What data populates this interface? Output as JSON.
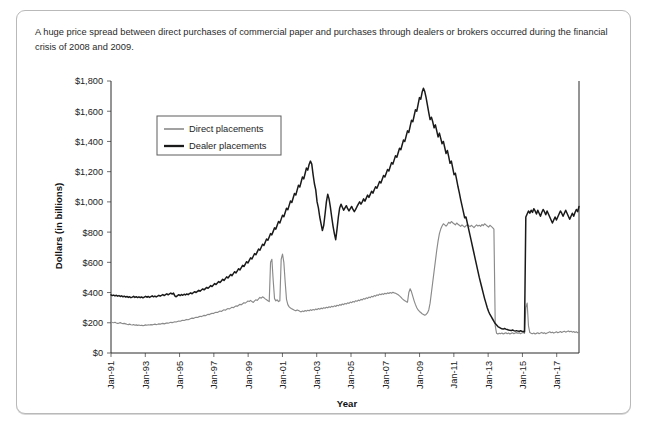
{
  "figure": {
    "caption": "A huge price spread between direct purchases of commercial paper and purchases through dealers or brokers occurred during the financial crisis of 2008 and 2009."
  },
  "legend": {
    "direct_label": "Direct placements",
    "dealer_label": "Dealer placements"
  },
  "axes": {
    "ylabel": "Dollars (in billions)",
    "xlabel": "Year"
  },
  "colors": {
    "direct": "#8a8a8a",
    "dealer": "#1a1a1a",
    "frame": "#b9b9b9",
    "axis": "#2b2b2b"
  },
  "chart_data": {
    "type": "line",
    "title": "",
    "xlabel": "Year",
    "ylabel": "Dollars (in billions)",
    "xlim": [
      "Jan-91",
      "Jan-18"
    ],
    "ylim": [
      0,
      1800
    ],
    "ytick_labels": [
      "$0",
      "$200",
      "$400",
      "$600",
      "$800",
      "$1,000",
      "$1,200",
      "$1,400",
      "$1,600",
      "$1,800"
    ],
    "ytick_values": [
      0,
      200,
      400,
      600,
      800,
      1000,
      1200,
      1400,
      1600,
      1800
    ],
    "ytick_step": 200,
    "xtick_labels": [
      "Jan-91",
      "Jan-93",
      "Jan-95",
      "Jan-97",
      "Jan-99",
      "Jan-01",
      "Jan-03",
      "Jan-05",
      "Jan-07",
      "Jan-09",
      "Jan-11",
      "Jan-13",
      "Jan-15",
      "Jan-17"
    ],
    "xtick_years": [
      1991,
      1993,
      1995,
      1997,
      1999,
      2001,
      2003,
      2005,
      2007,
      2009,
      2011,
      2013,
      2015,
      2017
    ],
    "grid": false,
    "legend_position": "upper-left-inside",
    "x_start_year": 1991,
    "x_end_year": 2018.3,
    "series": [
      {
        "name": "Direct placements",
        "color": "#8a8a8a",
        "values": [
          205,
          202,
          200,
          203,
          199,
          196,
          198,
          201,
          197,
          194,
          196,
          193,
          190,
          188,
          191,
          187,
          185,
          188,
          184,
          186,
          183,
          185,
          182,
          184,
          181,
          183,
          186,
          184,
          187,
          185,
          188,
          186,
          189,
          191,
          188,
          190,
          193,
          191,
          194,
          196,
          193,
          196,
          199,
          197,
          200,
          203,
          201,
          204,
          207,
          205,
          209,
          212,
          210,
          214,
          217,
          215,
          219,
          222,
          220,
          224,
          228,
          231,
          229,
          233,
          237,
          235,
          239,
          243,
          241,
          245,
          249,
          247,
          252,
          256,
          254,
          259,
          263,
          261,
          266,
          270,
          268,
          273,
          278,
          275,
          281,
          286,
          283,
          289,
          294,
          291,
          297,
          303,
          300,
          306,
          312,
          309,
          316,
          322,
          319,
          326,
          333,
          330,
          337,
          344,
          341,
          348,
          340,
          335,
          345,
          352,
          348,
          358,
          368,
          363,
          372,
          366,
          358,
          352,
          346,
          340,
          600,
          620,
          480,
          360,
          345,
          352,
          340,
          345,
          620,
          655,
          600,
          470,
          355,
          320,
          305,
          298,
          292,
          288,
          283,
          279,
          285,
          281,
          276,
          272,
          278,
          274,
          281,
          277,
          283,
          279,
          286,
          282,
          288,
          284,
          291,
          287,
          294,
          290,
          297,
          293,
          300,
          296,
          303,
          299,
          306,
          302,
          309,
          305,
          312,
          308,
          316,
          312,
          320,
          316,
          324,
          320,
          328,
          324,
          332,
          328,
          337,
          333,
          341,
          337,
          346,
          342,
          350,
          346,
          355,
          351,
          360,
          356,
          365,
          361,
          370,
          366,
          375,
          371,
          380,
          376,
          385,
          381,
          390,
          386,
          392,
          388,
          395,
          391,
          398,
          394,
          400,
          396,
          402,
          398,
          395,
          390,
          385,
          378,
          370,
          360,
          352,
          345,
          340,
          336,
          400,
          425,
          405,
          375,
          345,
          320,
          300,
          285,
          275,
          268,
          260,
          255,
          250,
          255,
          265,
          285,
          330,
          400,
          470,
          540,
          610,
          680,
          740,
          790,
          820,
          840,
          855,
          848,
          840,
          850,
          865,
          858,
          870,
          862,
          855,
          848,
          860,
          852,
          845,
          838,
          848,
          840,
          833,
          842,
          850,
          843,
          836,
          845,
          838,
          830,
          840,
          848,
          840,
          845,
          838,
          850,
          843,
          855,
          848,
          840,
          833,
          845,
          838,
          830,
          820,
          180,
          130,
          125,
          130,
          128,
          132,
          126,
          130,
          134,
          128,
          132,
          126,
          130,
          134,
          128,
          132,
          135,
          130,
          134,
          128,
          132,
          136,
          130,
          300,
          330,
          180,
          135,
          130,
          128,
          132,
          126,
          130,
          134,
          128,
          132,
          136,
          130,
          134,
          128,
          132,
          136,
          140,
          134,
          138,
          132,
          136,
          140,
          134,
          138,
          142,
          136,
          140,
          144,
          138,
          142,
          146,
          140,
          144,
          138,
          142,
          136,
          140,
          134,
          138
        ]
      },
      {
        "name": "Dealer placements",
        "color": "#1a1a1a",
        "values": [
          385,
          380,
          383,
          378,
          382,
          376,
          380,
          374,
          378,
          372,
          376,
          370,
          374,
          368,
          372,
          366,
          370,
          375,
          368,
          373,
          367,
          372,
          366,
          371,
          365,
          370,
          375,
          369,
          374,
          368,
          373,
          378,
          372,
          377,
          371,
          376,
          382,
          376,
          381,
          387,
          380,
          386,
          392,
          385,
          391,
          397,
          390,
          396,
          378,
          372,
          380,
          386,
          380,
          387,
          382,
          389,
          384,
          391,
          386,
          393,
          398,
          392,
          400,
          406,
          400,
          408,
          415,
          409,
          417,
          424,
          418,
          426,
          434,
          428,
          437,
          446,
          440,
          450,
          460,
          453,
          463,
          473,
          466,
          477,
          488,
          480,
          492,
          504,
          496,
          508,
          520,
          512,
          525,
          538,
          530,
          544,
          558,
          550,
          565,
          580,
          572,
          588,
          604,
          596,
          613,
          630,
          622,
          640,
          658,
          650,
          669,
          688,
          680,
          700,
          720,
          712,
          733,
          755,
          746,
          768,
          790,
          782,
          805,
          828,
          820,
          845,
          870,
          860,
          886,
          912,
          902,
          930,
          958,
          948,
          977,
          1006,
          996,
          1026,
          1056,
          1046,
          1078,
          1110,
          1098,
          1132,
          1165,
          1152,
          1188,
          1224,
          1210,
          1248,
          1270,
          1250,
          1180,
          1120,
          1080,
          1000,
          960,
          900,
          855,
          810,
          845,
          920,
          1000,
          1050,
          1020,
          965,
          900,
          840,
          790,
          750,
          820,
          900,
          960,
          985,
          965,
          945,
          960,
          975,
          955,
          940,
          955,
          970,
          950,
          935,
          950,
          968,
          985,
          1000,
          985,
          1000,
          1020,
          1005,
          1025,
          1045,
          1030,
          1050,
          1070,
          1058,
          1080,
          1100,
          1090,
          1112,
          1135,
          1125,
          1150,
          1175,
          1165,
          1190,
          1215,
          1205,
          1232,
          1260,
          1250,
          1278,
          1305,
          1295,
          1325,
          1355,
          1345,
          1378,
          1410,
          1400,
          1435,
          1470,
          1460,
          1500,
          1540,
          1530,
          1570,
          1610,
          1600,
          1645,
          1690,
          1680,
          1725,
          1752,
          1730,
          1690,
          1640,
          1590,
          1545,
          1560,
          1530,
          1490,
          1510,
          1470,
          1430,
          1455,
          1420,
          1385,
          1400,
          1360,
          1320,
          1340,
          1300,
          1255,
          1270,
          1225,
          1180,
          1190,
          1145,
          1100,
          1060,
          1015,
          975,
          935,
          895,
          900,
          860,
          820,
          780,
          740,
          700,
          660,
          620,
          580,
          540,
          500,
          465,
          430,
          395,
          360,
          330,
          300,
          275,
          255,
          240,
          225,
          210,
          195,
          185,
          175,
          170,
          165,
          160,
          158,
          162,
          158,
          155,
          152,
          150,
          148,
          152,
          148,
          145,
          148,
          145,
          143,
          147,
          144,
          142,
          140,
          900,
          920,
          940,
          925,
          945,
          930,
          955,
          940,
          920,
          945,
          925,
          905,
          930,
          950,
          935,
          915,
          940,
          920,
          900,
          880,
          860,
          880,
          900,
          880,
          900,
          920,
          940,
          925,
          905,
          925,
          945,
          925,
          905,
          885,
          905,
          925,
          905,
          930,
          950,
          935,
          970
        ]
      }
    ]
  }
}
